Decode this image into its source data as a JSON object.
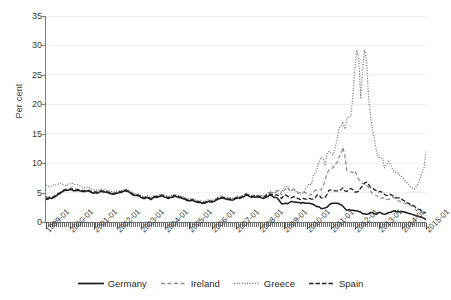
{
  "chart_data": {
    "type": "line",
    "title": "",
    "subtitle": "",
    "xlabel": "",
    "ylabel": "Per cent",
    "ylim": [
      0,
      35
    ],
    "ytick_labels": [
      "0",
      "5",
      "10",
      "15",
      "20",
      "25",
      "30",
      "35"
    ],
    "ytick_values": [
      0,
      5,
      10,
      15,
      20,
      25,
      30,
      35
    ],
    "grid": "horizontal-light",
    "legend_position": "bottom-center",
    "x_start": "1999-01",
    "x_end": "2015-01",
    "x_tick_interval": "1 month (minor), 1 year (major labelled)",
    "xtick_labels": [
      "1999-01",
      "2000-01",
      "2001-01",
      "2002-01",
      "2003-01",
      "2004-01",
      "2005-01",
      "2006-01",
      "2007-01",
      "2008-01",
      "2009-01",
      "2010-01",
      "2011-01",
      "2012-01",
      "2013-01",
      "2014-01",
      "2015-01"
    ],
    "x_years": [
      1999,
      2000,
      2001,
      2002,
      2003,
      2004,
      2005,
      2006,
      2007,
      2008,
      2009,
      2010,
      2011,
      2012,
      2013,
      2014,
      2015
    ],
    "series": [
      {
        "name": "Germany",
        "color": "#1a1a1a",
        "style": "solid",
        "values": [
          3.8,
          3.9,
          4.1,
          4.0,
          4.2,
          4.4,
          4.7,
          4.8,
          5.1,
          5.3,
          5.4,
          5.4,
          5.5,
          5.5,
          5.3,
          5.3,
          5.4,
          5.3,
          5.2,
          5.2,
          5.2,
          5.3,
          5.2,
          5.0,
          4.9,
          5.0,
          4.9,
          5.1,
          5.2,
          5.1,
          5.1,
          5.0,
          4.9,
          4.8,
          4.7,
          4.8,
          4.9,
          5.0,
          5.0,
          5.2,
          5.3,
          5.2,
          5.1,
          4.8,
          4.6,
          4.5,
          4.5,
          4.4,
          4.2,
          4.0,
          4.0,
          4.2,
          4.0,
          3.8,
          4.1,
          4.2,
          4.2,
          4.3,
          4.4,
          4.4,
          4.2,
          4.1,
          4.0,
          4.2,
          4.2,
          4.4,
          4.3,
          4.2,
          4.1,
          4.0,
          3.9,
          3.7,
          3.6,
          3.6,
          3.7,
          3.5,
          3.4,
          3.3,
          3.3,
          3.2,
          3.2,
          3.3,
          3.5,
          3.4,
          3.4,
          3.5,
          3.7,
          3.9,
          4.0,
          4.1,
          4.0,
          3.9,
          3.8,
          3.8,
          3.7,
          3.8,
          4.0,
          4.1,
          4.0,
          4.2,
          4.3,
          4.6,
          4.5,
          4.3,
          4.2,
          4.3,
          4.2,
          4.3,
          4.2,
          4.1,
          4.0,
          4.2,
          4.3,
          4.6,
          4.5,
          4.2,
          4.2,
          4.0,
          3.6,
          3.1,
          3.1,
          3.2,
          3.1,
          3.3,
          3.5,
          3.4,
          3.4,
          3.3,
          3.3,
          3.2,
          3.3,
          3.2,
          3.2,
          3.2,
          3.1,
          3.0,
          2.8,
          2.6,
          2.6,
          2.3,
          2.3,
          2.4,
          2.5,
          2.9,
          3.1,
          3.2,
          3.2,
          3.2,
          3.1,
          2.9,
          2.7,
          2.3,
          2.0,
          2.1,
          2.0,
          2.0,
          1.9,
          1.9,
          1.8,
          1.7,
          1.4,
          1.4,
          1.3,
          1.4,
          1.6,
          1.6,
          1.4,
          1.3,
          1.6,
          1.6,
          1.4,
          1.3,
          1.4,
          1.6,
          1.6,
          1.8,
          1.9,
          1.8,
          1.7,
          1.8,
          1.8,
          1.7,
          1.6,
          1.5,
          1.4,
          1.3,
          1.2,
          1.0,
          1.0,
          0.9,
          0.8,
          0.6,
          0.4
        ]
      },
      {
        "name": "Ireland",
        "color": "#8c8c8c",
        "style": "dashed-light",
        "values": [
          4.3,
          4.2,
          4.3,
          4.2,
          4.4,
          4.6,
          4.9,
          5.0,
          5.3,
          5.5,
          5.6,
          5.6,
          5.7,
          5.8,
          5.6,
          5.6,
          5.6,
          5.5,
          5.4,
          5.4,
          5.4,
          5.5,
          5.4,
          5.2,
          5.1,
          5.2,
          5.1,
          5.3,
          5.4,
          5.3,
          5.3,
          5.2,
          5.1,
          5.0,
          4.9,
          5.0,
          5.1,
          5.2,
          5.2,
          5.4,
          5.5,
          5.4,
          5.3,
          5.0,
          4.8,
          4.7,
          4.7,
          4.6,
          4.4,
          4.2,
          4.2,
          4.4,
          4.2,
          4.0,
          4.3,
          4.4,
          4.4,
          4.5,
          4.6,
          4.6,
          4.4,
          4.3,
          4.2,
          4.4,
          4.4,
          4.6,
          4.5,
          4.4,
          4.3,
          4.2,
          4.1,
          3.9,
          3.8,
          3.8,
          3.9,
          3.7,
          3.6,
          3.5,
          3.5,
          3.4,
          3.4,
          3.5,
          3.7,
          3.6,
          3.6,
          3.7,
          3.9,
          4.1,
          4.2,
          4.3,
          4.2,
          4.1,
          4.0,
          4.0,
          3.9,
          4.0,
          4.2,
          4.3,
          4.2,
          4.4,
          4.5,
          4.8,
          4.7,
          4.5,
          4.4,
          4.5,
          4.4,
          4.5,
          4.4,
          4.4,
          4.4,
          4.6,
          4.8,
          5.0,
          5.0,
          4.8,
          5.0,
          5.3,
          5.1,
          4.6,
          5.2,
          5.6,
          5.9,
          5.4,
          5.2,
          5.6,
          5.4,
          5.1,
          5.0,
          4.9,
          5.1,
          5.0,
          4.7,
          4.6,
          4.6,
          5.0,
          5.4,
          5.4,
          5.4,
          5.5,
          6.1,
          7.0,
          8.3,
          8.8,
          9.1,
          9.2,
          9.9,
          10.0,
          11.0,
          11.5,
          12.7,
          11.3,
          8.8,
          8.6,
          8.5,
          8.4,
          8.7,
          8.0,
          7.3,
          6.9,
          6.5,
          6.6,
          6.2,
          5.9,
          5.2,
          4.8,
          4.6,
          4.5,
          4.3,
          4.0,
          4.1,
          4.1,
          3.9,
          3.8,
          4.0,
          4.2,
          4.1,
          3.7,
          3.6,
          3.5,
          3.3,
          3.2,
          3.1,
          3.0,
          2.8,
          2.7,
          2.4,
          2.0,
          1.8,
          1.7,
          1.5,
          1.3,
          1.1
        ]
      },
      {
        "name": "Greece",
        "color": "#6f6f6f",
        "style": "dotted",
        "values": [
          6.3,
          6.1,
          6.0,
          6.2,
          6.4,
          6.3,
          6.4,
          6.6,
          6.5,
          6.3,
          6.2,
          6.3,
          6.5,
          6.6,
          6.4,
          6.3,
          6.3,
          6.2,
          6.0,
          5.9,
          5.8,
          5.9,
          5.8,
          5.6,
          5.4,
          5.5,
          5.4,
          5.5,
          5.6,
          5.5,
          5.5,
          5.4,
          5.3,
          5.2,
          5.1,
          5.2,
          5.3,
          5.3,
          5.3,
          5.5,
          5.6,
          5.5,
          5.4,
          5.1,
          4.9,
          4.8,
          4.8,
          4.7,
          4.5,
          4.3,
          4.3,
          4.5,
          4.3,
          4.1,
          4.4,
          4.5,
          4.5,
          4.6,
          4.7,
          4.7,
          4.5,
          4.4,
          4.3,
          4.5,
          4.5,
          4.7,
          4.6,
          4.5,
          4.4,
          4.3,
          4.2,
          4.0,
          3.9,
          3.9,
          4.0,
          3.8,
          3.7,
          3.6,
          3.6,
          3.5,
          3.5,
          3.6,
          3.8,
          3.7,
          3.7,
          3.8,
          4.0,
          4.2,
          4.3,
          4.4,
          4.3,
          4.2,
          4.1,
          4.1,
          4.0,
          4.1,
          4.3,
          4.4,
          4.3,
          4.5,
          4.6,
          4.9,
          4.8,
          4.6,
          4.5,
          4.6,
          4.5,
          4.6,
          4.5,
          4.5,
          4.5,
          4.7,
          4.9,
          5.2,
          5.1,
          4.9,
          5.1,
          5.5,
          5.3,
          5.1,
          5.7,
          6.0,
          6.1,
          5.6,
          5.4,
          5.5,
          5.3,
          4.9,
          4.8,
          4.7,
          5.0,
          5.5,
          6.0,
          6.5,
          6.3,
          7.8,
          8.3,
          9.1,
          10.3,
          11.0,
          10.8,
          9.6,
          11.6,
          12.0,
          11.7,
          11.4,
          12.4,
          13.9,
          15.9,
          16.3,
          17.0,
          15.8,
          17.4,
          17.9,
          18.0,
          21.1,
          25.9,
          29.2,
          27.8,
          21.1,
          26.0,
          29.3,
          27.1,
          21.1,
          17.9,
          15.7,
          13.9,
          12.0,
          11.0,
          10.9,
          10.8,
          9.2,
          9.8,
          10.3,
          9.8,
          9.1,
          8.5,
          8.4,
          8.3,
          7.9,
          7.6,
          7.2,
          6.9,
          6.5,
          6.1,
          5.8,
          5.6,
          6.0,
          6.6,
          7.4,
          8.4,
          9.2,
          12.0
        ]
      },
      {
        "name": "Spain",
        "color": "#232323",
        "style": "dashed-dark",
        "values": [
          4.1,
          4.0,
          4.2,
          4.1,
          4.3,
          4.5,
          4.8,
          4.9,
          5.2,
          5.4,
          5.5,
          5.5,
          5.6,
          5.6,
          5.4,
          5.4,
          5.5,
          5.4,
          5.3,
          5.3,
          5.3,
          5.4,
          5.3,
          5.1,
          5.0,
          5.1,
          5.0,
          5.2,
          5.3,
          5.2,
          5.2,
          5.1,
          5.0,
          4.9,
          4.8,
          4.9,
          5.0,
          5.1,
          5.1,
          5.3,
          5.4,
          5.3,
          5.2,
          4.9,
          4.7,
          4.6,
          4.6,
          4.5,
          4.3,
          4.1,
          4.1,
          4.3,
          4.1,
          3.9,
          4.2,
          4.3,
          4.3,
          4.4,
          4.5,
          4.5,
          4.3,
          4.2,
          4.1,
          4.3,
          4.3,
          4.5,
          4.4,
          4.3,
          4.2,
          4.1,
          4.0,
          3.8,
          3.7,
          3.7,
          3.8,
          3.6,
          3.5,
          3.4,
          3.4,
          3.3,
          3.3,
          3.4,
          3.6,
          3.5,
          3.5,
          3.6,
          3.8,
          4.0,
          4.1,
          4.2,
          4.1,
          4.0,
          3.9,
          3.9,
          3.8,
          3.9,
          4.1,
          4.2,
          4.1,
          4.3,
          4.4,
          4.7,
          4.6,
          4.4,
          4.3,
          4.4,
          4.3,
          4.4,
          4.3,
          4.3,
          4.2,
          4.4,
          4.6,
          4.8,
          4.7,
          4.5,
          4.6,
          4.6,
          4.3,
          4.0,
          4.4,
          4.6,
          4.4,
          4.2,
          4.1,
          4.3,
          4.2,
          4.0,
          3.9,
          3.8,
          4.0,
          3.9,
          3.9,
          4.0,
          3.9,
          3.9,
          4.1,
          4.6,
          4.6,
          4.1,
          4.1,
          4.2,
          4.7,
          5.4,
          5.4,
          5.3,
          5.3,
          5.3,
          5.3,
          5.5,
          5.8,
          5.3,
          5.2,
          5.5,
          5.7,
          5.5,
          5.1,
          5.1,
          5.2,
          5.8,
          6.1,
          6.6,
          6.8,
          6.4,
          5.9,
          5.7,
          5.5,
          5.3,
          5.1,
          5.2,
          5.0,
          4.7,
          4.5,
          4.6,
          4.7,
          4.5,
          4.3,
          4.1,
          4.1,
          4.1,
          3.8,
          3.6,
          3.3,
          3.2,
          3.0,
          2.9,
          2.7,
          2.4,
          2.2,
          2.1,
          1.9,
          1.7,
          1.5
        ]
      }
    ]
  },
  "legend": {
    "items": [
      {
        "label": "Germany",
        "style": "solid",
        "color": "#1a1a1a"
      },
      {
        "label": "Ireland",
        "style": "dashed-light",
        "color": "#8c8c8c"
      },
      {
        "label": "Greece",
        "style": "dotted",
        "color": "#6f6f6f"
      },
      {
        "label": "Spain",
        "style": "dashed-dark",
        "color": "#232323"
      }
    ]
  }
}
